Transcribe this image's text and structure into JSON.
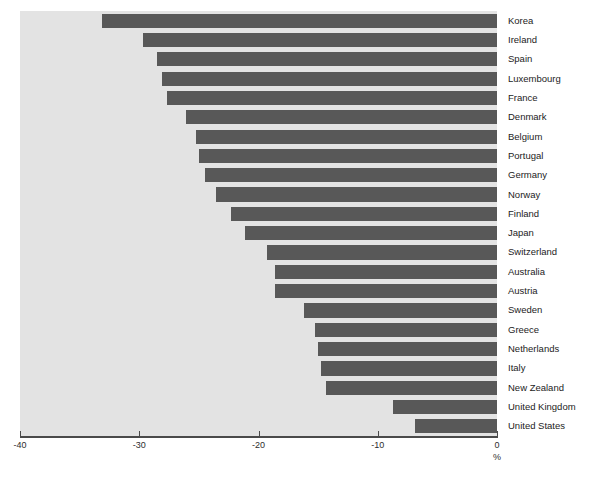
{
  "chart_data": {
    "type": "bar",
    "orientation": "horizontal",
    "title": "",
    "xlabel": "%",
    "ylabel": "",
    "xlim": [
      -40,
      0
    ],
    "xticks": [
      -40,
      -30,
      -20,
      -10,
      0
    ],
    "xtick_labels": [
      "-40",
      "-30",
      "-20",
      "-10",
      "0"
    ],
    "grid": false,
    "legend": null,
    "bar_color": "#585858",
    "panel_color": "#e3e3e3",
    "categories": [
      "Korea",
      "Ireland",
      "Spain",
      "Luxembourg",
      "France",
      "Denmark",
      "Belgium",
      "Portugal",
      "Germany",
      "Norway",
      "Finland",
      "Japan",
      "Switzerland",
      "Australia",
      "Austria",
      "Sweden",
      "Greece",
      "Netherlands",
      "Italy",
      "New Zealand",
      "United Kingdom",
      "United States"
    ],
    "values": [
      -33.1,
      -29.7,
      -28.5,
      -28.1,
      -27.7,
      -26.1,
      -25.2,
      -25.0,
      -24.5,
      -23.6,
      -22.3,
      -21.1,
      -19.3,
      -18.6,
      -18.6,
      -16.2,
      -15.3,
      -15.0,
      -14.8,
      -14.3,
      -8.7,
      -6.9
    ]
  },
  "footer": {
    "note": ""
  }
}
